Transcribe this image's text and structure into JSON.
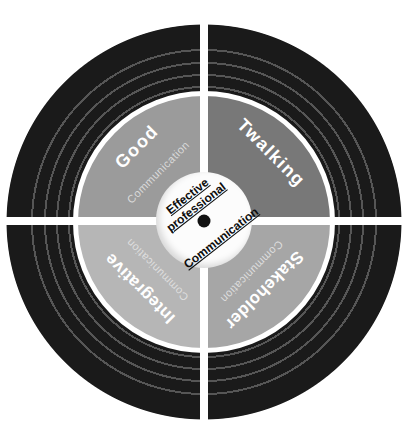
{
  "diagram": {
    "type": "four-quadrant communication wheel",
    "center": {
      "title_line1": "Effective",
      "title_line2": "professional",
      "title_line3": "Communication"
    },
    "quadrants": {
      "top_left": {
        "title": "Good",
        "subtitle": "Communication",
        "color": "#9b9b9b"
      },
      "top_right": {
        "title": "Twalking",
        "color": "#787878"
      },
      "bottom_left": {
        "title": "Integrative",
        "subtitle": "Communication",
        "color": "#b6b6b6"
      },
      "bottom_right": {
        "title": "Stakeholder",
        "subtitle": "Communication",
        "color": "#a6a6a6"
      }
    },
    "colors": {
      "outer_ring": "#1a1a1a",
      "groove_line": "#565656",
      "divider": "#ffffff",
      "hub_fill": "#fcfcfc",
      "hub_dot": "#111111",
      "quadrant_title_text": "#ffffff",
      "quadrant_subtitle_text": "#dadada",
      "center_text": "#0d0d0d"
    }
  }
}
